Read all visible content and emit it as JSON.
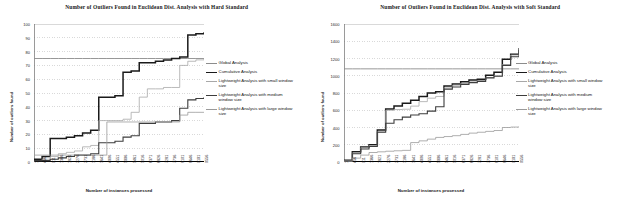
{
  "figure": {
    "axis_x_title": "Number of instances processed",
    "axis_y_title": "Number of outliers found"
  },
  "legend": {
    "items": [
      {
        "label": "Global Analysis",
        "color": "#8c8c8c",
        "width": 0.9
      },
      {
        "label": "Cumulative Analysis",
        "color": "#1a1a1a",
        "width": 1.5
      },
      {
        "label": "Lightweight Analysis with small window size",
        "color": "#a8a8a8",
        "width": 0.8
      },
      {
        "label": "Lightweight Analysis with medium window size",
        "color": "#3d3d3d",
        "width": 1.1
      },
      {
        "label": "Lightweight Analysis with large window size",
        "color": "#9a9a9a",
        "width": 0.8
      }
    ]
  },
  "chart_data": [
    {
      "type": "line",
      "title": "Number of Outliers Found in Euclidean Dist. Analysis with Hard Standard",
      "xlabel": "Number of instances processed",
      "ylabel": "Number of outliers found",
      "grid": true,
      "legend_position": "right",
      "ylim": [
        0,
        100
      ],
      "yticks": [
        0,
        10,
        20,
        30,
        40,
        50,
        60,
        70,
        80,
        90,
        100
      ],
      "xlim": [
        1,
        9556
      ],
      "xticks": [
        1,
        456,
        911,
        1366,
        1821,
        2276,
        2731,
        3186,
        3641,
        4096,
        4551,
        5006,
        5461,
        5916,
        6371,
        6826,
        7281,
        7736,
        8191,
        8646,
        9101,
        9556
      ],
      "x": [
        1,
        456,
        911,
        1366,
        1821,
        2276,
        2731,
        3186,
        3641,
        4096,
        4551,
        5006,
        5461,
        5916,
        6371,
        6826,
        7281,
        7736,
        8191,
        8646,
        9101,
        9556
      ],
      "series": [
        {
          "name": "Global Analysis",
          "color": "#8c8c8c",
          "width": 0.9,
          "values": [
            75,
            75,
            75,
            75,
            75,
            75,
            75,
            75,
            75,
            75,
            75,
            75,
            75,
            75,
            75,
            75,
            75,
            75,
            75,
            75,
            75,
            75
          ]
        },
        {
          "name": "Cumulative Analysis",
          "color": "#1a1a1a",
          "width": 1.5,
          "values": [
            2,
            4,
            17,
            17,
            18,
            19,
            21,
            23,
            47,
            47,
            48,
            65,
            66,
            72,
            72,
            73,
            74,
            75,
            76,
            92,
            93,
            94
          ]
        },
        {
          "name": "Lightweight Analysis with small window size",
          "color": "#a8a8a8",
          "width": 0.8,
          "values": [
            1,
            2,
            4,
            6,
            7,
            8,
            11,
            12,
            30,
            30,
            30,
            31,
            36,
            47,
            53,
            53,
            54,
            54,
            70,
            73,
            74,
            75
          ]
        },
        {
          "name": "Lightweight Analysis with medium window size",
          "color": "#3d3d3d",
          "width": 1.1,
          "values": [
            1,
            1,
            2,
            3,
            4,
            5,
            5,
            6,
            14,
            14,
            15,
            18,
            19,
            28,
            28,
            29,
            29,
            30,
            39,
            45,
            46,
            47
          ]
        },
        {
          "name": "Lightweight Analysis with large window size",
          "color": "#9a9a9a",
          "width": 0.8,
          "values": [
            5,
            5,
            5,
            5,
            5,
            5,
            5,
            5,
            5,
            29,
            29,
            29,
            29,
            29,
            29,
            29,
            29,
            29,
            34,
            36,
            36,
            36
          ]
        }
      ]
    },
    {
      "type": "line",
      "title": "Number of Outliers Found in Euclidean Dist. Analysis with Soft Standard",
      "xlabel": "Number of instances processed",
      "ylabel": "Number of outliers found",
      "grid": true,
      "legend_position": "right",
      "ylim": [
        0,
        1600
      ],
      "yticks": [
        0,
        200,
        400,
        600,
        800,
        1000,
        1200,
        1400,
        1600
      ],
      "xlim": [
        1,
        9556
      ],
      "xticks": [
        1,
        456,
        911,
        1366,
        1821,
        2276,
        2731,
        3186,
        3641,
        4096,
        4551,
        5006,
        5461,
        5916,
        6371,
        6826,
        7281,
        7736,
        8191,
        8646,
        9101,
        9556
      ],
      "x": [
        1,
        456,
        911,
        1366,
        1821,
        2276,
        2731,
        3186,
        3641,
        4096,
        4551,
        5006,
        5461,
        5916,
        6371,
        6826,
        7281,
        7736,
        8191,
        8646,
        9101,
        9556
      ],
      "series": [
        {
          "name": "Global Analysis",
          "color": "#8c8c8c",
          "width": 0.9,
          "values": [
            1080,
            1080,
            1080,
            1080,
            1080,
            1080,
            1080,
            1080,
            1080,
            1080,
            1080,
            1080,
            1080,
            1080,
            1080,
            1080,
            1080,
            1080,
            1080,
            1080,
            1080,
            1080
          ]
        },
        {
          "name": "Cumulative Analysis",
          "color": "#1a1a1a",
          "width": 1.5,
          "values": [
            20,
            120,
            175,
            200,
            370,
            615,
            650,
            680,
            715,
            760,
            800,
            815,
            880,
            905,
            930,
            950,
            960,
            1005,
            1040,
            1190,
            1250,
            1320
          ]
        },
        {
          "name": "Lightweight Analysis with small window size",
          "color": "#a8a8a8",
          "width": 0.8,
          "values": [
            15,
            105,
            165,
            190,
            350,
            600,
            608,
            612,
            648,
            700,
            740,
            760,
            860,
            890,
            912,
            930,
            945,
            980,
            1000,
            1130,
            1240,
            1310
          ]
        },
        {
          "name": "Lightweight Analysis with medium window size",
          "color": "#3d3d3d",
          "width": 1.1,
          "values": [
            12,
            95,
            150,
            180,
            345,
            450,
            490,
            520,
            545,
            560,
            590,
            640,
            845,
            870,
            900,
            920,
            935,
            975,
            995,
            1120,
            1220,
            1300
          ]
        },
        {
          "name": "Lightweight Analysis with large window size",
          "color": "#9a9a9a",
          "width": 0.8,
          "values": [
            8,
            45,
            80,
            110,
            118,
            125,
            130,
            135,
            225,
            245,
            265,
            285,
            295,
            305,
            320,
            335,
            345,
            355,
            365,
            400,
            405,
            410
          ]
        }
      ]
    }
  ]
}
